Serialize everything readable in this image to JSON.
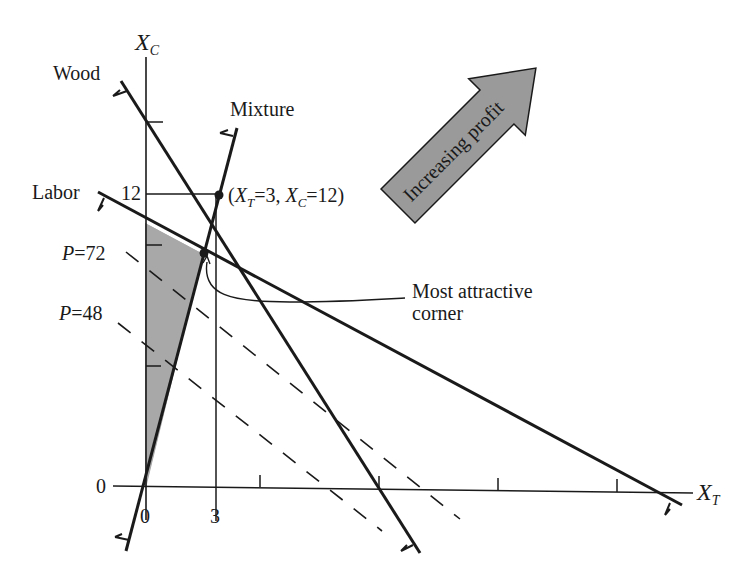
{
  "diagram": {
    "type": "linear-programming-feasible-region",
    "axes": {
      "x": {
        "label": "X",
        "subscript": "T"
      },
      "y": {
        "label": "X",
        "subscript": "C"
      }
    },
    "ticks": {
      "x_origin": "0",
      "x_three": "3",
      "y_origin": "0",
      "y_twelve": "12"
    },
    "constraints": [
      {
        "name": "Wood",
        "label": "Wood"
      },
      {
        "name": "Mixture",
        "label": "Mixture"
      },
      {
        "name": "Labor",
        "label": "Labor"
      }
    ],
    "profit_lines": [
      {
        "label_var": "P",
        "label_eq": "=",
        "value": "72"
      },
      {
        "label_var": "P",
        "label_eq": "=",
        "value": "48"
      }
    ],
    "point": {
      "open": "(",
      "xt_var": "X",
      "xt_sub": "T",
      "xt_eq": "=3, ",
      "xc_var": "X",
      "xc_sub": "C",
      "xc_eq": "=12)"
    },
    "arrow_label": "Increasing profit",
    "annotation_line1": "Most attractive",
    "annotation_line2": "corner",
    "colors": {
      "ink": "#1a1a1a",
      "feasible_fill": "#a8a8a8",
      "arrow_fill": "#9a9a9a"
    }
  }
}
